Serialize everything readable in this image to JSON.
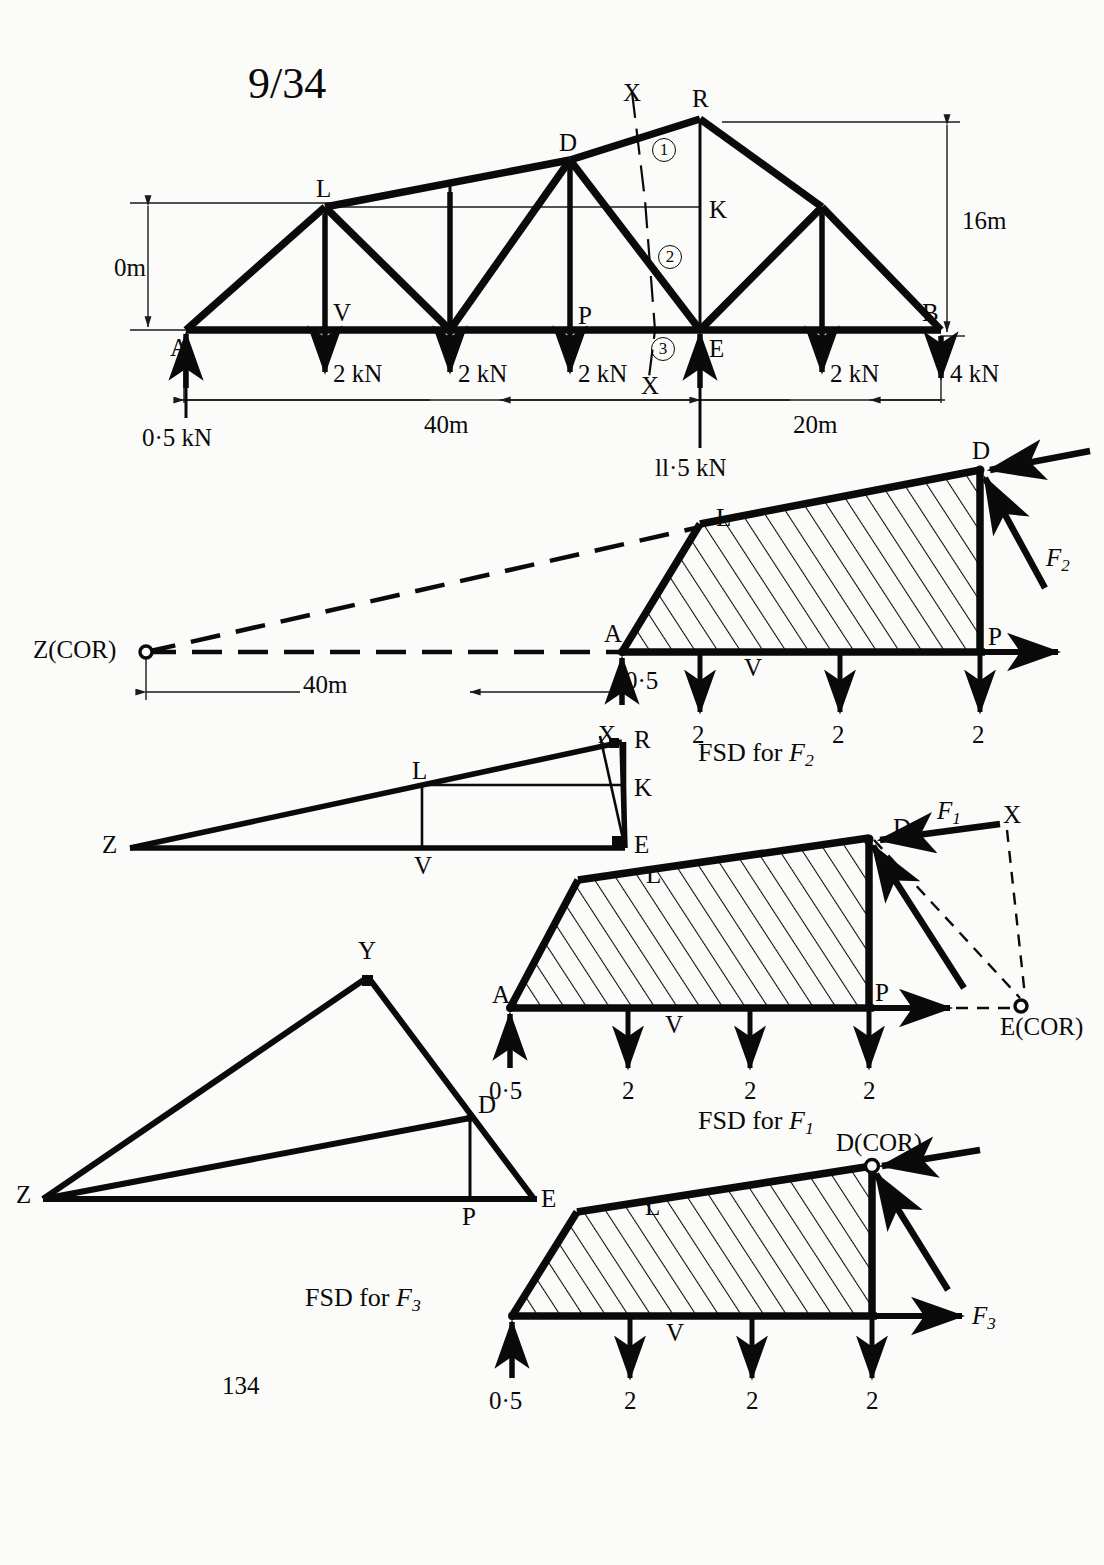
{
  "page": {
    "figure_number": "9/34",
    "page_number": "134"
  },
  "truss": {
    "nodes": {
      "A": "A",
      "L": "L",
      "V": "V",
      "D": "D",
      "P": "P",
      "R": "R",
      "K": "K",
      "E": "E",
      "B": "B"
    },
    "section_markers": {
      "x_top": "X",
      "x_bottom": "X"
    },
    "member_labels": {
      "one": "1",
      "two": "2",
      "three": "3"
    },
    "loads": [
      {
        "value": "2 kN",
        "dir": "down"
      },
      {
        "value": "2 kN",
        "dir": "down"
      },
      {
        "value": "2 kN",
        "dir": "down"
      },
      {
        "value": "2 kN",
        "dir": "down"
      },
      {
        "value": "4 kN",
        "dir": "down"
      }
    ],
    "reactions": [
      {
        "label": "0·5 kN",
        "dir": "up"
      },
      {
        "label": "ll·5 kN",
        "dir": "up"
      }
    ],
    "dimensions": {
      "height_left": "0m",
      "height_right": "16m",
      "span_left": "40m",
      "span_right": "20m"
    }
  },
  "fsd_f2": {
    "caption_prefix": "FSD for",
    "caption_symbol": "F",
    "caption_sub": "2",
    "cor_label": "Z(COR)",
    "dim": "40m",
    "force_label": "F",
    "force_sub": "2",
    "nodes": {
      "A": "A",
      "L": "L",
      "D": "D",
      "P": "P",
      "V": "V"
    },
    "loads": [
      "2",
      "2",
      "2"
    ],
    "reaction": "0·5"
  },
  "aux_zxre": {
    "nodes": {
      "Z": "Z",
      "L": "L",
      "V": "V",
      "X": "X",
      "R": "R",
      "K": "K",
      "E": "E"
    }
  },
  "fsd_f1": {
    "caption_prefix": "FSD for",
    "caption_symbol": "F",
    "caption_sub": "1",
    "cor_label": "E(COR)",
    "force_label": "F",
    "force_sub": "1",
    "section_marker": "X",
    "nodes": {
      "A": "A",
      "L": "L",
      "D": "D",
      "P": "P",
      "V": "V"
    },
    "loads": [
      "2",
      "2",
      "2"
    ],
    "reaction": "0·5"
  },
  "aux_zyde": {
    "nodes": {
      "Z": "Z",
      "Y": "Y",
      "D": "D",
      "P": "P",
      "E": "E"
    }
  },
  "fsd_f3": {
    "caption_prefix": "FSD for",
    "caption_symbol": "F",
    "caption_sub": "3",
    "cor_label": "D(COR)",
    "force_label": "F",
    "force_sub": "3",
    "nodes": {
      "L": "L",
      "V": "V"
    },
    "loads": [
      "2",
      "2",
      "2"
    ],
    "reaction": "0·5"
  },
  "colors": {
    "ink": "#0a0a0a",
    "paper": "#fbfbf9",
    "thin": "#1a1a1a"
  }
}
